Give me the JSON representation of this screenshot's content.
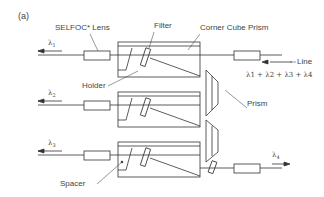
{
  "figure": {
    "panel_label": "(a)",
    "labels": {
      "selfoc_lens": "SELFOC* Lens",
      "filter": "Filter",
      "corner_cube_prism": "Corner Cube Prism",
      "line": "Line",
      "holder": "Holder",
      "prism": "Prism",
      "spacer": "Spacer",
      "combined_wavelengths": "λ1 + λ2 + λ3 + λ4"
    },
    "channels": [
      {
        "symbol": "λ",
        "sub": "1"
      },
      {
        "symbol": "λ",
        "sub": "2"
      },
      {
        "symbol": "λ",
        "sub": "3"
      },
      {
        "symbol": "λ",
        "sub": "4"
      }
    ],
    "colors": {
      "line": "#333333",
      "background": "#ffffff"
    }
  }
}
